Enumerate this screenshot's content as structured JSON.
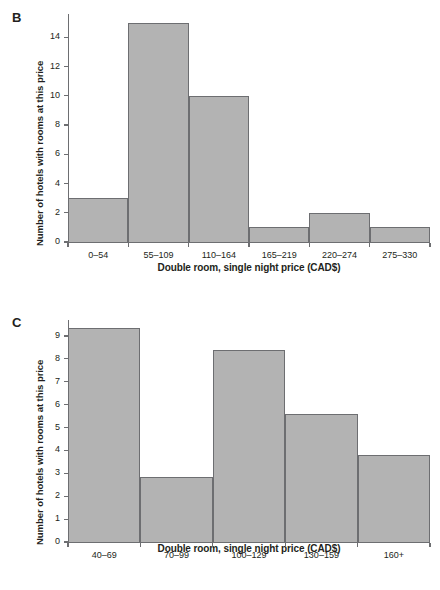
{
  "figure": {
    "background_color": "#ffffff",
    "bar_fill_color": "#b3b3b3",
    "bar_edge_color": "#6d6e71",
    "axis_color": "#6d6e71",
    "text_color": "#231f20"
  },
  "panels": [
    {
      "letter": "B",
      "ylabel": "Number of hotels with rooms at this price",
      "xlabel": "Double room, single night price (CAD$)",
      "ytick_labels": [
        "0",
        "2",
        "4",
        "6",
        "8",
        "10",
        "12",
        "14"
      ],
      "xtick_labels": [
        "0–54",
        "55–109",
        "110–164",
        "165–219",
        "220–274",
        "275–330"
      ]
    },
    {
      "letter": "C",
      "ylabel": "Number of hotels with rooms at this price",
      "xlabel": "Double room, single night price (CAD$)",
      "ytick_labels": [
        "0",
        "1",
        "2",
        "3",
        "4",
        "5",
        "6",
        "7",
        "8",
        "9"
      ],
      "xtick_labels": [
        "40–69",
        "70–99",
        "100–129",
        "130–159",
        "160+"
      ]
    }
  ],
  "chart_data": [
    {
      "type": "bar",
      "panel": "B",
      "title": "",
      "xlabel": "Double room, single night price (CAD$)",
      "ylabel": "Number of hotels with rooms at this price",
      "categories": [
        "0–54",
        "55–109",
        "110–164",
        "165–219",
        "220–274",
        "275–330"
      ],
      "values": [
        3,
        15,
        10,
        1,
        2,
        1
      ],
      "yticks": [
        0,
        2,
        4,
        6,
        8,
        10,
        12,
        14
      ],
      "ylim": [
        0,
        15.6
      ],
      "grid": false,
      "legend": "none"
    },
    {
      "type": "bar",
      "panel": "C",
      "title": "",
      "xlabel": "Double room, single night price (CAD$)",
      "ylabel": "Number of hotels with rooms at this price",
      "categories": [
        "40–69",
        "70–99",
        "100–129",
        "130–159",
        "160+"
      ],
      "values": [
        9.35,
        2.85,
        8.4,
        5.6,
        3.8
      ],
      "yticks": [
        0,
        1,
        2,
        3,
        4,
        5,
        6,
        7,
        8,
        9
      ],
      "ylim": [
        0,
        9.7
      ],
      "grid": false,
      "legend": "none"
    }
  ]
}
